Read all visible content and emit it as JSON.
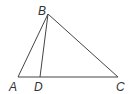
{
  "diagram": {
    "type": "triangle",
    "points": {
      "A": {
        "label": "A",
        "x": 18,
        "y": 77,
        "label_x": 9,
        "label_y": 91
      },
      "B": {
        "label": "B",
        "x": 48,
        "y": 14,
        "label_x": 38,
        "label_y": 15
      },
      "C": {
        "label": "C",
        "x": 118,
        "y": 77,
        "label_x": 116,
        "label_y": 91
      },
      "D": {
        "label": "D",
        "x": 40,
        "y": 77,
        "label_x": 34,
        "label_y": 91
      }
    },
    "segments": [
      [
        "A",
        "B"
      ],
      [
        "B",
        "C"
      ],
      [
        "A",
        "C"
      ],
      [
        "B",
        "D"
      ]
    ],
    "stroke_color": "#444444"
  }
}
